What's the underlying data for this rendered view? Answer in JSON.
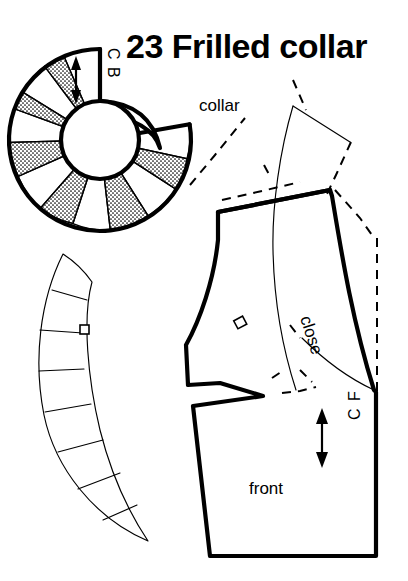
{
  "page": {
    "background_color": "#ffffff",
    "ink_color": "#000000",
    "width": 408,
    "height": 581
  },
  "title": {
    "number": "23",
    "text": "Frilled collar",
    "full": "23 Frilled collar"
  },
  "labels": {
    "collar": "collar",
    "front": "front",
    "close": "close",
    "center_back": "C B",
    "center_front": "C F"
  },
  "pieces": [
    {
      "id": "circular-collar",
      "name": "Circular frilled collar, slashed and spread",
      "label": "C B",
      "grainline": "double-headed arrow",
      "segment_count": 12,
      "stippled_segments": 6,
      "plain_segments": 6
    },
    {
      "id": "collar-strip",
      "name": "Flattened curved collar band",
      "segment_count": 8,
      "notch": "single square notch on inner edge"
    },
    {
      "id": "bodice-front",
      "name": "Bodice front block with collar overlay",
      "label": "front",
      "grainline": "double-headed arrow",
      "center_front": "C F",
      "closure": "close"
    }
  ],
  "legend": {
    "heavy_line": "finished pattern outline",
    "thin_line": "construction / overlay line",
    "dashed_line": "original block outline",
    "stipple_fill": "spread insert wedge"
  }
}
